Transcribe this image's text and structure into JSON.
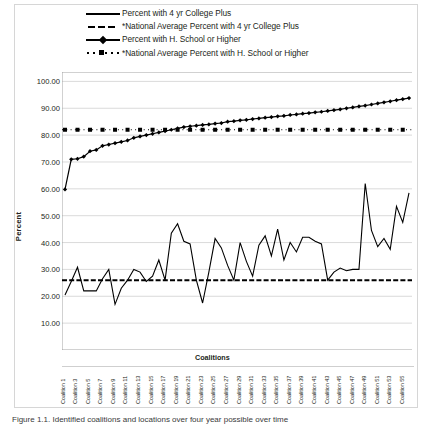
{
  "figure": {
    "caption": "Figure 1.1.   Identified coalitions and locations over four year possible over time"
  },
  "legend": {
    "position": "top-center",
    "items": [
      {
        "label": "Percent with 4 yr College Plus",
        "style": "solid",
        "key": "line-solid-icon"
      },
      {
        "label": "*National Average Percent with 4 yr College Plus",
        "style": "dashed",
        "key": "line-dashed-icon"
      },
      {
        "label": "Percent with H. School or Higher",
        "style": "solid-marker",
        "key": "line-solid-marker-icon"
      },
      {
        "label": "*National Average Percent with H. School or Higher",
        "style": "dotted-marker",
        "key": "line-dotted-marker-icon"
      }
    ]
  },
  "chart_data": {
    "type": "line",
    "title": "",
    "xlabel": "Coalitions",
    "ylabel": "Percent",
    "ylim": [
      0,
      100
    ],
    "yticks": [
      "10.00",
      "20.00",
      "30.00",
      "40.00",
      "50.00",
      "60.00",
      "70.00",
      "80.00",
      "90.00",
      "100.00"
    ],
    "grid": "horizontal",
    "x_tick_labels": [
      "Coalition 1",
      "Coalition 3",
      "Coalition 5",
      "Coalition 7",
      "Coalition 9",
      "Coalition 11",
      "Coalition 13",
      "Coalition 15",
      "Coalition 17",
      "Coalition 19",
      "Coalition 21",
      "Coalition 23",
      "Coalition 25",
      "Coalition 27",
      "Coalition 29",
      "Coalition 31",
      "Coalition 33",
      "Coalition 35",
      "Coalition 37",
      "Coalition 39",
      "Coalition 41",
      "Coalition 43",
      "Coalition 45",
      "Coalition 47",
      "Coalition 49",
      "Coalition 51",
      "Coalition 53",
      "Coalition 55"
    ],
    "x": [
      1,
      2,
      3,
      4,
      5,
      6,
      7,
      8,
      9,
      10,
      11,
      12,
      13,
      14,
      15,
      16,
      17,
      18,
      19,
      20,
      21,
      22,
      23,
      24,
      25,
      26,
      27,
      28,
      29,
      30,
      31,
      32,
      33,
      34,
      35,
      36,
      37,
      38,
      39,
      40,
      41,
      42,
      43,
      44,
      45,
      46,
      47,
      48,
      49,
      50,
      51,
      52,
      53,
      54,
      55,
      56
    ],
    "series": [
      {
        "name": "Percent with 4 yr College Plus",
        "style": "solid",
        "values": [
          20.5,
          25.5,
          30.8,
          22.0,
          22.0,
          22.0,
          26.5,
          30.0,
          17.0,
          23.0,
          26.0,
          30.0,
          29.0,
          25.5,
          27.5,
          33.5,
          26.0,
          43.5,
          47.0,
          40.5,
          39.5,
          26.0,
          17.5,
          29.0,
          41.5,
          38.0,
          31.5,
          26.0,
          40.0,
          33.0,
          27.5,
          39.0,
          42.5,
          35.0,
          45.0,
          33.5,
          40.0,
          36.5,
          42.0,
          42.0,
          40.5,
          39.5,
          26.0,
          29.0,
          30.5,
          29.5,
          30.0,
          30.0,
          62.0,
          44.5,
          38.5,
          41.5,
          37.5,
          53.5,
          47.5,
          58.5
        ]
      },
      {
        "name": "*National Average Percent with 4 yr College Plus",
        "style": "dashed",
        "value": 26.0
      },
      {
        "name": "Percent with H. School or Higher",
        "style": "solid-marker",
        "values": [
          59.8,
          71.0,
          71.2,
          72.0,
          74.0,
          74.5,
          76.0,
          76.5,
          77.0,
          77.5,
          78.0,
          79.0,
          79.5,
          80.0,
          80.5,
          81.0,
          81.5,
          82.0,
          82.5,
          83.0,
          83.3,
          83.5,
          83.8,
          84.0,
          84.3,
          84.5,
          85.0,
          85.2,
          85.5,
          85.7,
          86.0,
          86.2,
          86.5,
          86.7,
          87.0,
          87.2,
          87.5,
          87.7,
          88.0,
          88.2,
          88.5,
          88.7,
          89.0,
          89.3,
          89.6,
          90.0,
          90.3,
          90.7,
          91.0,
          91.4,
          91.8,
          92.2,
          92.6,
          93.0,
          93.4,
          93.8
        ]
      },
      {
        "name": "*National Average Percent with H. School or Higher",
        "style": "dotted-marker",
        "value": 82.0
      }
    ]
  }
}
